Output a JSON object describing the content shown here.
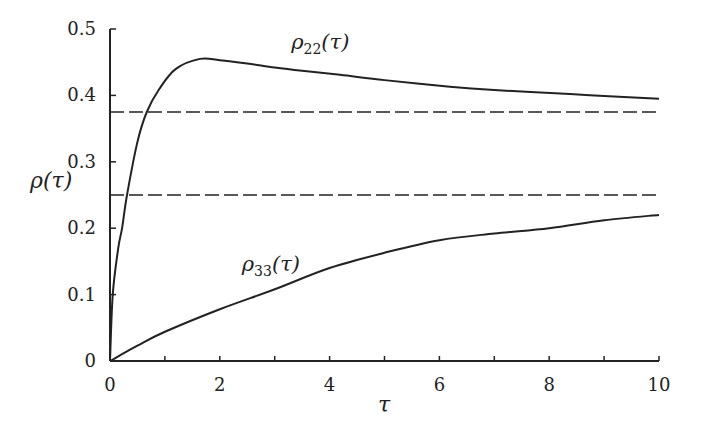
{
  "chart_data": {
    "type": "line",
    "title": "",
    "xlabel": "τ",
    "ylabel": "ρ(τ)",
    "xlim": [
      0,
      10
    ],
    "ylim": [
      0,
      0.5
    ],
    "grid": false,
    "legend": "none (inline curve labels)",
    "x_ticks": [
      0,
      2,
      4,
      6,
      8,
      10
    ],
    "x_minor_ticks": [
      1,
      3,
      5,
      7,
      9
    ],
    "y_ticks": [
      0,
      0.1,
      0.2,
      0.3,
      0.4,
      0.5
    ],
    "x_tick_labels": [
      "0",
      "2",
      "4",
      "6",
      "8",
      "10"
    ],
    "y_tick_labels": [
      "0",
      "0.1",
      "0.2",
      "0.3",
      "0.4",
      "0.5"
    ],
    "series": [
      {
        "name": "ρ22(τ)",
        "label_main": "ρ",
        "label_sub": "22",
        "label_arg": "(τ)",
        "style": "solid",
        "x": [
          0,
          0.05,
          0.15,
          0.22,
          0.31,
          0.5,
          0.67,
          0.9,
          1.2,
          1.64,
          2.0,
          2.5,
          3.0,
          3.5,
          4.19,
          5.0,
          6.19,
          7.0,
          8.38,
          9.0,
          10.0
        ],
        "values": [
          0,
          0.1,
          0.17,
          0.2,
          0.25,
          0.33,
          0.375,
          0.41,
          0.44,
          0.455,
          0.453,
          0.448,
          0.442,
          0.437,
          0.431,
          0.423,
          0.413,
          0.408,
          0.402,
          0.399,
          0.395
        ]
      },
      {
        "name": "ρ33(τ)",
        "label_main": "ρ",
        "label_sub": "33",
        "label_arg": "(τ)",
        "style": "solid",
        "x": [
          0,
          0.5,
          1,
          2,
          3,
          4,
          5,
          6,
          7,
          8,
          9,
          10
        ],
        "values": [
          0,
          0.023,
          0.044,
          0.078,
          0.108,
          0.14,
          0.163,
          0.182,
          0.192,
          0.2,
          0.212,
          0.22
        ]
      },
      {
        "name": "asymptote 0.375",
        "style": "dashed",
        "x": [
          0,
          10
        ],
        "values": [
          0.375,
          0.375
        ]
      },
      {
        "name": "asymptote 0.25",
        "style": "dashed",
        "x": [
          0,
          10
        ],
        "values": [
          0.25,
          0.25
        ]
      }
    ],
    "annotations": [
      {
        "text": "ρ22(τ)",
        "x": 3.3,
        "y": 0.47
      },
      {
        "text": "ρ33(τ)",
        "x": 2.4,
        "y": 0.135
      }
    ]
  },
  "layout": {
    "plot_left_px": 110,
    "plot_right_px": 659,
    "plot_top_px": 29,
    "plot_bottom_px": 361,
    "line_color": "#222222"
  }
}
